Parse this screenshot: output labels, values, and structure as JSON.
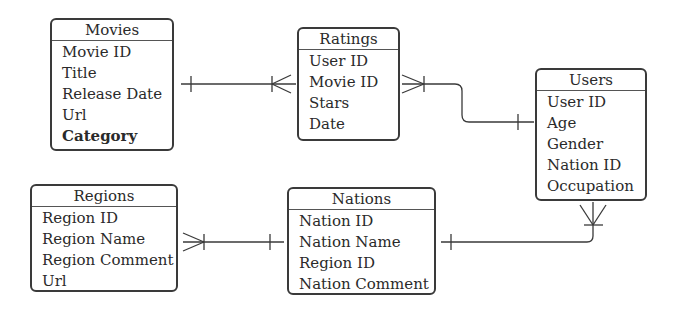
{
  "diagram": {
    "type": "entity-relationship",
    "entities": [
      {
        "name": "Movies",
        "attributes": [
          {
            "label": "Movie ID",
            "bold": false
          },
          {
            "label": "Title",
            "bold": false
          },
          {
            "label": "Release Date",
            "bold": false
          },
          {
            "label": "Url",
            "bold": false
          },
          {
            "label": "Category",
            "bold": true
          }
        ]
      },
      {
        "name": "Ratings",
        "attributes": [
          {
            "label": "User ID"
          },
          {
            "label": "Movie ID"
          },
          {
            "label": "Stars"
          },
          {
            "label": "Date"
          }
        ]
      },
      {
        "name": "Users",
        "attributes": [
          {
            "label": "User ID"
          },
          {
            "label": "Age"
          },
          {
            "label": "Gender"
          },
          {
            "label": "Nation ID"
          },
          {
            "label": "Occupation"
          }
        ]
      },
      {
        "name": "Regions",
        "attributes": [
          {
            "label": "Region ID"
          },
          {
            "label": "Region Name"
          },
          {
            "label": "Region Comment"
          },
          {
            "label": "Url"
          }
        ]
      },
      {
        "name": "Nations",
        "attributes": [
          {
            "label": "Nation ID"
          },
          {
            "label": "Nation Name"
          },
          {
            "label": "Region ID"
          },
          {
            "label": "Nation Comment"
          }
        ]
      }
    ],
    "relationships": [
      {
        "from": "Movies",
        "to": "Ratings",
        "from_cardinality": "one",
        "to_cardinality": "many"
      },
      {
        "from": "Users",
        "to": "Ratings",
        "from_cardinality": "one",
        "to_cardinality": "many"
      },
      {
        "from": "Nations",
        "to": "Users",
        "from_cardinality": "one",
        "to_cardinality": "many"
      },
      {
        "from": "Nations",
        "to": "Regions",
        "from_cardinality": "one",
        "to_cardinality": "many"
      }
    ]
  }
}
